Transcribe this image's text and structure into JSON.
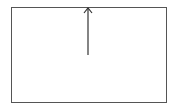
{
  "diagram": {
    "box": {
      "x": 11,
      "y": 7,
      "width": 155,
      "height": 95,
      "stroke": "#555555",
      "fill": "#ffffff"
    },
    "arrow": {
      "x": 88,
      "y_start": 55,
      "y_end": 7,
      "direction": "up",
      "stroke": "#333333"
    },
    "icons": {
      "arrow": "arrow-up-icon"
    }
  }
}
